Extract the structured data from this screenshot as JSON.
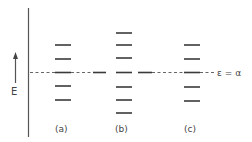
{
  "diagram": {
    "axis": {
      "label": "E",
      "direction": "up"
    },
    "reference_line": {
      "label": "ε = α",
      "y": 72
    },
    "columns": [
      {
        "id": "a",
        "label": "(a)",
        "x1": 55,
        "x2": 71,
        "levels": [
          45,
          59,
          72,
          86,
          100
        ]
      },
      {
        "id": "b",
        "label": "(b)",
        "x1": 116,
        "x2": 132,
        "levels": [
          33,
          45,
          58,
          72,
          87,
          100,
          113
        ]
      },
      {
        "id": "c",
        "label": "(c)",
        "x1": 184,
        "x2": 200,
        "levels": [
          45,
          59,
          72,
          87,
          101
        ]
      }
    ],
    "extra_segments": [
      {
        "x1": 93,
        "x2": 106,
        "y": 72
      },
      {
        "x1": 138,
        "x2": 152,
        "y": 72
      }
    ]
  }
}
